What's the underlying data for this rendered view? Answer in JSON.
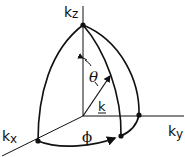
{
  "diagram": {
    "labels": {
      "kz": "k",
      "kz_sub": "z",
      "ky": "k",
      "ky_sub": "y",
      "kx": "k",
      "kx_sub": "x",
      "theta": "θ",
      "phi": "ϕ",
      "k_vector": "k"
    },
    "colors": {
      "line": "#111111",
      "background": "#ffffff"
    }
  }
}
